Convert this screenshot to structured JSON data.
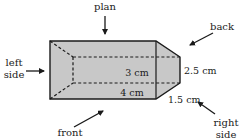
{
  "diagram": {
    "colors": {
      "fill": "#c8c8c8",
      "stroke": "#1a1a1a",
      "background": "#ffffff"
    },
    "view_labels": {
      "plan": "plan",
      "back": "back",
      "left_side_line1": "left",
      "left_side_line2": "side",
      "right_side_line1": "right",
      "right_side_line2": "side",
      "front": "front"
    },
    "dimensions": {
      "length": "4 cm",
      "inner_length": "3 cm",
      "height": "2.5 cm",
      "depth": "1.5 cm"
    }
  }
}
